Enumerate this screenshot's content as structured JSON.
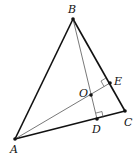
{
  "diagram": {
    "type": "geometry-triangle",
    "points": {
      "A": {
        "label": "A",
        "x": 15,
        "y": 139,
        "label_x": 10,
        "label_y": 153
      },
      "B": {
        "label": "B",
        "x": 73,
        "y": 19,
        "label_x": 68,
        "label_y": 13
      },
      "C": {
        "label": "C",
        "x": 125,
        "y": 111,
        "label_x": 124,
        "label_y": 126
      },
      "D": {
        "label": "D",
        "x": 97,
        "y": 119,
        "label_x": 92,
        "label_y": 133
      },
      "E": {
        "label": "E",
        "x": 110,
        "y": 83,
        "label_x": 114,
        "label_y": 85
      },
      "O": {
        "label": "O",
        "x": 91,
        "y": 95,
        "label_x": 79,
        "label_y": 97
      }
    },
    "segments": [
      {
        "from": "A",
        "to": "B",
        "weight": "thick"
      },
      {
        "from": "B",
        "to": "C",
        "weight": "thick"
      },
      {
        "from": "A",
        "to": "C",
        "weight": "thick"
      },
      {
        "from": "B",
        "to": "D",
        "weight": "thin"
      },
      {
        "from": "A",
        "to": "E",
        "weight": "thin"
      }
    ],
    "right_angles": [
      "D",
      "E"
    ],
    "colors": {
      "line": "#111111",
      "thin": "#555555"
    }
  }
}
